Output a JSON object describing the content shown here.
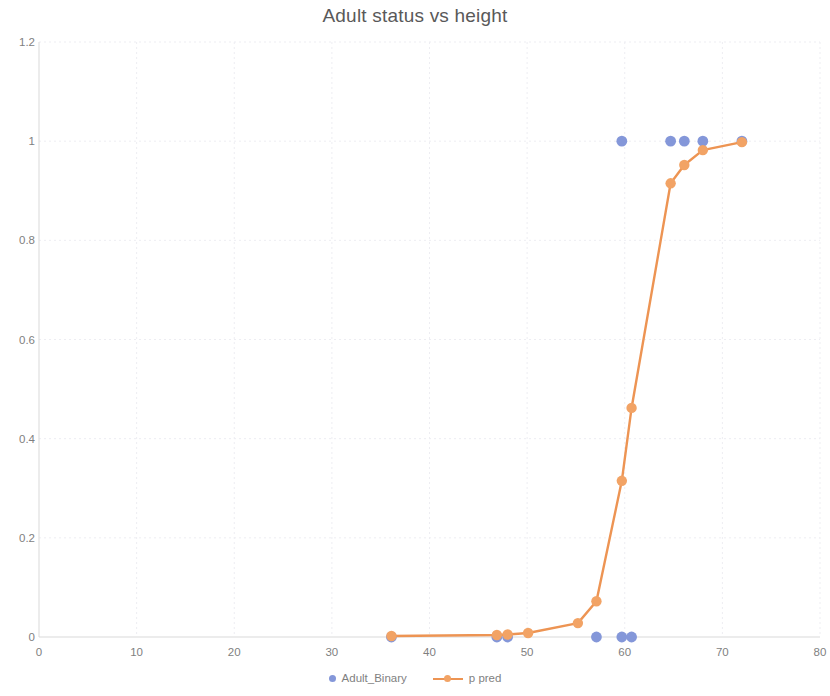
{
  "chart_data": {
    "type": "scatter",
    "title": "Adult status vs height",
    "xlabel": "",
    "ylabel": "",
    "xlim": [
      0,
      80
    ],
    "ylim": [
      0,
      1.2
    ],
    "xticks": [
      0,
      10,
      20,
      30,
      40,
      50,
      60,
      70,
      80
    ],
    "yticks": [
      0,
      0.2,
      0.4,
      0.6,
      0.8,
      1,
      1.2
    ],
    "xtick_labels": [
      "0",
      "10",
      "20",
      "30",
      "40",
      "50",
      "60",
      "70",
      "80"
    ],
    "ytick_labels": [
      "0",
      "0.2",
      "0.4",
      "0.6",
      "0.8",
      "1",
      "1.2"
    ],
    "grid": true,
    "legend_position": "bottom",
    "series": [
      {
        "name": "Adult_Binary",
        "type": "scatter",
        "color": "#8497d9",
        "points": [
          {
            "x": 36.1,
            "y": 0
          },
          {
            "x": 46.9,
            "y": 0
          },
          {
            "x": 48.0,
            "y": 0
          },
          {
            "x": 57.1,
            "y": 0
          },
          {
            "x": 59.7,
            "y": 0
          },
          {
            "x": 60.7,
            "y": 0
          },
          {
            "x": 59.7,
            "y": 1
          },
          {
            "x": 64.7,
            "y": 1
          },
          {
            "x": 66.1,
            "y": 1
          },
          {
            "x": 68.0,
            "y": 1
          },
          {
            "x": 72.0,
            "y": 1
          }
        ]
      },
      {
        "name": "p pred",
        "type": "line",
        "color": "#ed9453",
        "marker_color": "#f2a365",
        "points": [
          {
            "x": 36.1,
            "y": 0.002
          },
          {
            "x": 46.9,
            "y": 0.004
          },
          {
            "x": 48.0,
            "y": 0.005
          },
          {
            "x": 50.1,
            "y": 0.008
          },
          {
            "x": 55.2,
            "y": 0.028
          },
          {
            "x": 57.1,
            "y": 0.072
          },
          {
            "x": 59.7,
            "y": 0.315
          },
          {
            "x": 60.7,
            "y": 0.462
          },
          {
            "x": 64.7,
            "y": 0.915
          },
          {
            "x": 66.1,
            "y": 0.952
          },
          {
            "x": 68.0,
            "y": 0.982
          },
          {
            "x": 72.0,
            "y": 0.998
          }
        ]
      }
    ]
  },
  "legend": {
    "items": [
      {
        "label": "Adult_Binary"
      },
      {
        "label": "p pred"
      }
    ]
  }
}
